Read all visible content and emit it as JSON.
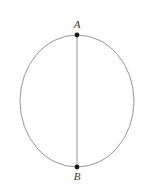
{
  "figure": {
    "type": "geometry-diagram",
    "background_color": "#ffffff",
    "stroke_color": "#8a8a8a",
    "point_color": "#1a1a1a",
    "label_color": "#3a3a3a",
    "circle": {
      "center_x": 77,
      "center_y": 101,
      "radius_x": 57,
      "radius_y": 66,
      "stroke_width": 0.9
    },
    "chord": {
      "name": "AB",
      "x1": 77,
      "y1": 35,
      "x2": 77,
      "y2": 167,
      "stroke_width": 0.9
    },
    "points": [
      {
        "id": "A",
        "label": "A",
        "x": 77,
        "y": 35,
        "marker_size": 2.4,
        "label_position": "above"
      },
      {
        "id": "B",
        "label": "B",
        "x": 77,
        "y": 167,
        "marker_size": 2.4,
        "label_position": "below"
      }
    ]
  }
}
